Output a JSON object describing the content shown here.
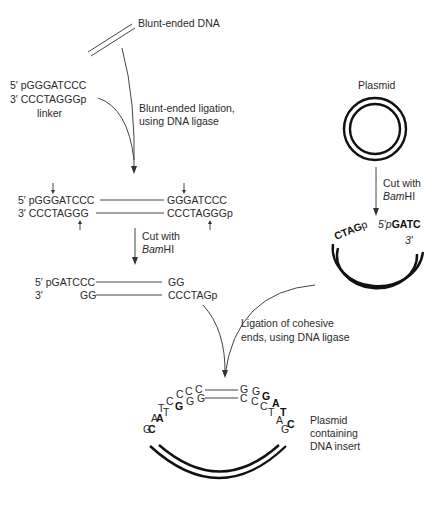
{
  "labels": {
    "blunt_dna": "Blunt-ended DNA",
    "linker_top": "5′ pGGGATCCC",
    "linker_bottom": "3′    CCCTAGGGp",
    "linker": "linker",
    "blunt_ligation_1": "Blunt-ended ligation,",
    "blunt_ligation_2": "using DNA ligase",
    "plasmid": "Plasmid",
    "cut_with": "Cut with",
    "bamhi_ital": "Bam",
    "bamhi_rest": "HI",
    "ligated_top_left": "5′ pGGGATCCC",
    "ligated_top_right": "GGGATCCC",
    "ligated_bot_left": "3′    CCCTAGGG",
    "ligated_bot_right": "CCCTAGGGp",
    "cut_top_left": "5′ pGATCCC",
    "cut_top_right": "GG",
    "cut_bot_5": "3′",
    "cut_bot_left": "GG",
    "cut_bot_right": "CCCTAGp",
    "plasmid_cut_left": "CTAG",
    "plasmid_cut_left_p": "p",
    "plasmid_cut_right_prefix": "5′p",
    "plasmid_cut_right": "GATC",
    "plasmid_cut_right_3": "3′",
    "cohesive_1": "Ligation of cohesive",
    "cohesive_2": "ends, using DNA ligase",
    "result_1": "Plasmid",
    "result_2": "containing",
    "result_3": "DNA insert",
    "insert_top_left": "C",
    "insert_top_right": "G",
    "insert_bot_left": "G",
    "insert_bot_right": "C"
  }
}
